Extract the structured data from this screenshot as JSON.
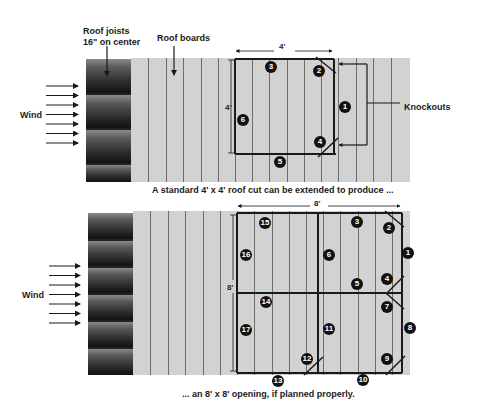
{
  "top_panel": {
    "labels": {
      "roof_joists_line1": "Roof joists",
      "roof_joists_line2": "16\" on center",
      "roof_boards": "Roof boards",
      "wind": "Wind",
      "knockouts": "Knockouts",
      "width_dim": "4'",
      "height_dim": "4'"
    },
    "cut_numbers": [
      "1",
      "2",
      "3",
      "4",
      "5",
      "6"
    ],
    "caption": "A standard 4' x 4' roof cut can be extended to produce ..."
  },
  "bottom_panel": {
    "labels": {
      "wind": "Wind",
      "width_dim": "8'",
      "height_dim": "8'"
    },
    "cut_numbers": [
      "1",
      "2",
      "3",
      "4",
      "5",
      "6",
      "7",
      "8",
      "9",
      "10",
      "11",
      "12",
      "13",
      "14",
      "15",
      "16",
      "17"
    ],
    "caption": "... an 8' x 8' opening, if planned properly."
  },
  "colors": {
    "board_fill": "#d2d2d2",
    "board_line": "#6e6e6e",
    "cut_line": "#1a1a1a",
    "joist_dark": "#111111",
    "joist_light": "#8a8a8a"
  }
}
